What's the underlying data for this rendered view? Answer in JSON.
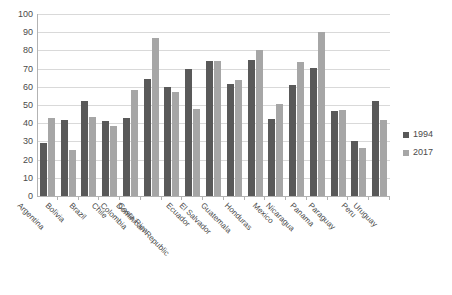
{
  "chart_data": {
    "type": "bar",
    "title": "",
    "subtitle": "",
    "xlabel": "",
    "ylabel": "",
    "ylim": [
      0,
      100
    ],
    "ytick_step": 10,
    "yticks": [
      100,
      90,
      80,
      70,
      60,
      50,
      40,
      30,
      20,
      10,
      0
    ],
    "grid": true,
    "legend_position": "right",
    "categories": [
      "Argentina",
      "Bolivia",
      "Brazil",
      "Chile",
      "Colombia",
      "Costa Rica",
      "Dominican Republic",
      "Ecuador",
      "El Salvador",
      "Guatemala",
      "Honduras",
      "Mexico",
      "Nicaragua",
      "Panama",
      "Paraguay",
      "Peru",
      "Uruguay"
    ],
    "series": [
      {
        "name": "1994",
        "color": "#595959",
        "values": [
          29,
          42,
          52,
          41,
          43,
          64.5,
          60,
          70,
          74,
          61.5,
          75,
          42.5,
          61,
          70.5,
          46.5,
          30.5,
          52
        ]
      },
      {
        "name": "2017",
        "color": "#a6a6a6",
        "values": [
          43,
          25.5,
          43.5,
          38.5,
          58,
          87,
          57,
          48,
          74,
          63.5,
          80,
          50.5,
          73.5,
          90,
          47.5,
          26.5,
          41.5
        ]
      }
    ]
  },
  "legend": {
    "items": [
      {
        "label": "1994",
        "color": "#595959"
      },
      {
        "label": "2017",
        "color": "#a6a6a6"
      }
    ]
  }
}
